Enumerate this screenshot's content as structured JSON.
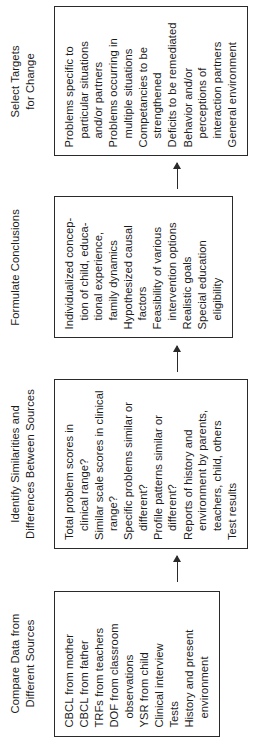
{
  "diagram": {
    "type": "flowchart",
    "orientation": "rotated-90-ccw",
    "stage_count": 4,
    "colors": {
      "text": "#1a1a1a",
      "border": "#2a2a2a",
      "background": "#ffffff"
    }
  },
  "stages": [
    {
      "header": "Compare Data from\nDifferent Sources",
      "items": [
        {
          "text": "CBCL from mother"
        },
        {
          "text": "CBCL from father"
        },
        {
          "text": "TRFs from teachers"
        },
        {
          "text": "DOF from classroom",
          "cont": "observations"
        },
        {
          "text": "YSR from child"
        },
        {
          "text": "Clinical interview"
        },
        {
          "text": "Tests"
        },
        {
          "text": "History and present",
          "cont": "environment"
        }
      ]
    },
    {
      "header": "Identify Similarities and\nDifferences Between Sources",
      "items": [
        {
          "text": "Total problem scores in",
          "cont": "clinical range?"
        },
        {
          "text": "Similar scale scores in clinical",
          "cont": "range?"
        },
        {
          "text": "Specific problems similar or",
          "cont": "different?"
        },
        {
          "text": "Profile patterns similar or",
          "cont": "different?"
        },
        {
          "text": "Reports of history and",
          "cont": "environment by parents,\nteachers, child, others"
        },
        {
          "text": "Test results"
        }
      ]
    },
    {
      "header": "Formulate Conclusions",
      "items": [
        {
          "text": "Individualized concep-",
          "cont": "tion of child, educa-\ntional experience,\nfamily dynamics"
        },
        {
          "text": "Hypothesized causal",
          "cont": "factors"
        },
        {
          "text": "Feasibility of various",
          "cont": "intervention options"
        },
        {
          "text": "Realistic goals"
        },
        {
          "text": "Special education",
          "cont": "eligibility"
        }
      ]
    },
    {
      "header": "Select Targets\nfor Change",
      "items": [
        {
          "text": "Problems specific to",
          "cont": "particular situations\nand/or partners"
        },
        {
          "text": "Problems occurring in",
          "cont": "multiple situations"
        },
        {
          "text": "Competancies to be",
          "cont": "strengthened"
        },
        {
          "text": "Deficits to be remediated"
        },
        {
          "text": "Behavior and/or",
          "cont": "perceptions of\ninteraction partners"
        },
        {
          "text": "General environment"
        }
      ]
    }
  ]
}
